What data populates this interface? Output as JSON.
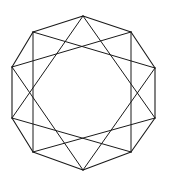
{
  "figure": {
    "name": "regular-decagon-with-star-polygon",
    "canvas": {
      "width": 169,
      "height": 183,
      "background_color": "#ffffff"
    },
    "stroke": {
      "color": "#1a1a1a",
      "width": 1.1,
      "star_width": 1.0
    },
    "polygon": {
      "type": "decagon",
      "sides": 10,
      "center_x": 83.5,
      "center_y": 93,
      "radius_x": 71.5,
      "radius_y": 77,
      "rotation_degrees": -90,
      "vertex_count": 10,
      "vertices": [
        {
          "index": 0,
          "label": "top",
          "x": 83,
          "y": 16
        },
        {
          "index": 1,
          "label": "upper-right",
          "x": 131,
          "y": 32
        },
        {
          "index": 2,
          "label": "right-upper",
          "x": 155,
          "y": 68
        },
        {
          "index": 3,
          "label": "right-lower",
          "x": 155,
          "y": 118
        },
        {
          "index": 4,
          "label": "lower-right",
          "x": 131,
          "y": 152
        },
        {
          "index": 5,
          "label": "bottom",
          "x": 83,
          "y": 170
        },
        {
          "index": 6,
          "label": "lower-left",
          "x": 33,
          "y": 152
        },
        {
          "index": 7,
          "label": "left-lower",
          "x": 12,
          "y": 118
        },
        {
          "index": 8,
          "label": "left-upper",
          "x": 12,
          "y": 67
        },
        {
          "index": 9,
          "label": "upper-left",
          "x": 33,
          "y": 32
        }
      ],
      "edges": [
        [
          0,
          1
        ],
        [
          1,
          2
        ],
        [
          2,
          3
        ],
        [
          3,
          4
        ],
        [
          4,
          5
        ],
        [
          5,
          6
        ],
        [
          6,
          7
        ],
        [
          7,
          8
        ],
        [
          8,
          9
        ],
        [
          9,
          0
        ]
      ]
    },
    "star_polygon": {
      "schlafli": "{10/3}",
      "step": 3,
      "chord_count": 10,
      "chords": [
        [
          0,
          3
        ],
        [
          1,
          4
        ],
        [
          2,
          5
        ],
        [
          3,
          6
        ],
        [
          4,
          7
        ],
        [
          5,
          8
        ],
        [
          6,
          9
        ],
        [
          7,
          0
        ],
        [
          8,
          1
        ],
        [
          9,
          2
        ]
      ]
    }
  }
}
